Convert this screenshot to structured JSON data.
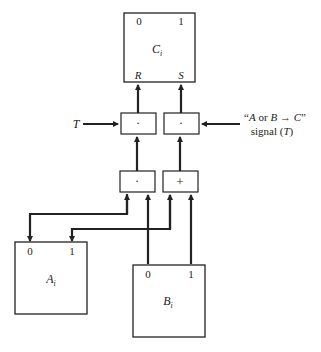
{
  "diagram": {
    "registers": {
      "C": {
        "name": "C",
        "subscript": "i",
        "top_left": "0",
        "top_right": "1",
        "bottom_left": "R",
        "bottom_right": "S"
      },
      "A": {
        "name": "A",
        "subscript": "i",
        "top_left": "0",
        "top_right": "1"
      },
      "B": {
        "name": "B",
        "subscript": "i",
        "top_left": "0",
        "top_right": "1"
      }
    },
    "gates": {
      "upper_left": "·",
      "upper_right": "·",
      "lower_left": "·",
      "lower_right": "+"
    },
    "inputs": {
      "left_T": "T",
      "right_line1_open": "“",
      "right_line1_A": "A",
      "right_line1_or": " or ",
      "right_line1_B": "B",
      "right_line1_arrow": " → ",
      "right_line1_C": "C",
      "right_line1_close": "”",
      "right_line2_prefix": "signal (",
      "right_line2_T": "T",
      "right_line2_suffix": ")"
    }
  }
}
